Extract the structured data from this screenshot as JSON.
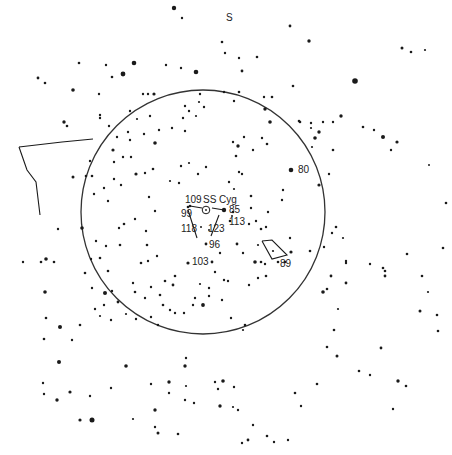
{
  "orientation_label": "S",
  "target": {
    "name": "SS Cyg",
    "x": 206,
    "y": 210
  },
  "field_circle": {
    "cx": 203,
    "cy": 212,
    "r": 122
  },
  "colors": {
    "ink": "#1a1a1a",
    "background": "#ffffff"
  },
  "labels": [
    {
      "id": "orient-s",
      "text": "S",
      "x": 226,
      "y": 13
    },
    {
      "id": "target",
      "text": "SS Cyg",
      "x": 203,
      "y": 195
    },
    {
      "id": "m109",
      "text": "109",
      "x": 185,
      "y": 195
    },
    {
      "id": "m99",
      "text": "99",
      "x": 181,
      "y": 209
    },
    {
      "id": "m85",
      "text": "85",
      "x": 229,
      "y": 205
    },
    {
      "id": "m113",
      "text": "113",
      "x": 229,
      "y": 217
    },
    {
      "id": "m118",
      "text": "118",
      "x": 181,
      "y": 224
    },
    {
      "id": "m123",
      "text": "123",
      "x": 208,
      "y": 224
    },
    {
      "id": "m96",
      "text": "96",
      "x": 209,
      "y": 240
    },
    {
      "id": "m103",
      "text": "103",
      "x": 192,
      "y": 257
    },
    {
      "id": "m80",
      "text": "80",
      "x": 298,
      "y": 165
    },
    {
      "id": "m89",
      "text": "89",
      "x": 280,
      "y": 259
    }
  ],
  "comparison_stars": [
    {
      "label": "109",
      "x": 190,
      "y": 206,
      "r": 1.3
    },
    {
      "label": "99",
      "x": 188,
      "y": 207,
      "r": 1.3
    },
    {
      "label": "85",
      "x": 224,
      "y": 210,
      "r": 2.2
    },
    {
      "label": "113",
      "x": 232,
      "y": 216,
      "r": 1.0
    },
    {
      "label": "118",
      "x": 201,
      "y": 227,
      "r": 1.0
    },
    {
      "label": "123",
      "x": 209,
      "y": 230,
      "r": 1.0
    },
    {
      "label": "96",
      "x": 206,
      "y": 244,
      "r": 1.4
    },
    {
      "label": "103",
      "x": 188,
      "y": 263,
      "r": 1.6
    },
    {
      "label": "80",
      "x": 291,
      "y": 170,
      "r": 2.3
    },
    {
      "label": "89",
      "x": 278,
      "y": 262,
      "r": 1.3
    }
  ],
  "lines": [
    {
      "pts": [
        [
          190,
          206
        ],
        [
          202,
          208
        ]
      ]
    },
    {
      "pts": [
        [
          212,
          208
        ],
        [
          224,
          210
        ]
      ]
    },
    {
      "pts": [
        [
          188,
          210
        ],
        [
          197,
          238
        ]
      ]
    },
    {
      "pts": [
        [
          219,
          215
        ],
        [
          211,
          236
        ]
      ]
    },
    {
      "pts": [
        [
          262,
          241
        ],
        [
          272,
          240
        ],
        [
          287,
          255
        ],
        [
          272,
          259
        ],
        [
          262,
          241
        ]
      ]
    },
    {
      "pts": [
        [
          19,
          147
        ],
        [
          62,
          142
        ],
        [
          93,
          139
        ]
      ]
    },
    {
      "pts": [
        [
          19,
          147
        ],
        [
          27,
          170
        ],
        [
          36,
          182
        ],
        [
          40,
          215
        ]
      ]
    }
  ],
  "stars": [
    [
      174,
      8,
      2.2
    ],
    [
      182,
      18,
      1.2
    ],
    [
      38,
      78,
      1.4
    ],
    [
      45,
      83,
      1.3
    ],
    [
      73,
      90,
      1.8
    ],
    [
      79,
      63,
      1.3
    ],
    [
      106,
      65,
      1.2
    ],
    [
      134,
      63,
      2.3
    ],
    [
      123,
      74,
      2.4
    ],
    [
      166,
      65,
      1.2
    ],
    [
      181,
      68,
      1.2
    ],
    [
      196,
      72,
      2.3
    ],
    [
      222,
      42,
      1.3
    ],
    [
      242,
      71,
      1.4
    ],
    [
      200,
      94,
      1.2
    ],
    [
      148,
      94,
      1.2
    ],
    [
      143,
      94,
      1.2
    ],
    [
      154,
      94,
      1.6
    ],
    [
      112,
      77,
      1.3
    ],
    [
      99,
      94,
      1.2
    ],
    [
      64,
      122,
      1.7
    ],
    [
      67,
      126,
      1.3
    ],
    [
      100,
      118,
      1.2
    ],
    [
      130,
      111,
      1.2
    ],
    [
      225,
      53,
      1.2
    ],
    [
      239,
      58,
      1.2
    ],
    [
      257,
      57,
      1.3
    ],
    [
      290,
      26,
      1.4
    ],
    [
      309,
      41,
      1.7
    ],
    [
      402,
      48,
      1.5
    ],
    [
      411,
      52,
      1.3
    ],
    [
      425,
      50,
      1.1
    ],
    [
      355,
      81,
      2.8
    ],
    [
      293,
      86,
      1.3
    ],
    [
      264,
      97,
      1.2
    ],
    [
      239,
      92,
      1.3
    ],
    [
      265,
      109,
      1.7
    ],
    [
      272,
      97,
      1.3
    ],
    [
      270,
      122,
      1.8
    ],
    [
      300,
      122,
      1.3
    ],
    [
      311,
      123,
      1.2
    ],
    [
      323,
      122,
      1.2
    ],
    [
      333,
      122,
      1.2
    ],
    [
      341,
      116,
      1.7
    ],
    [
      363,
      127,
      1.3
    ],
    [
      374,
      130,
      1.2
    ],
    [
      315,
      138,
      1.8
    ],
    [
      319,
      132,
      1.7
    ],
    [
      311,
      128,
      1.1
    ],
    [
      299,
      121,
      1.3
    ],
    [
      312,
      147,
      1.1
    ],
    [
      391,
      150,
      1.2
    ],
    [
      383,
      137,
      2.0
    ],
    [
      397,
      142,
      1.6
    ],
    [
      429,
      165,
      1.0
    ],
    [
      446,
      203,
      1.3
    ],
    [
      443,
      248,
      1.3
    ],
    [
      422,
      276,
      1.3
    ],
    [
      383,
      268,
      1.3
    ],
    [
      385,
      276,
      1.4
    ],
    [
      428,
      292,
      1.1
    ],
    [
      420,
      311,
      1.5
    ],
    [
      437,
      315,
      1.3
    ],
    [
      438,
      331,
      1.3
    ],
    [
      334,
      330,
      1.3
    ],
    [
      338,
      309,
      1.1
    ],
    [
      398,
      381,
      1.7
    ],
    [
      406,
      386,
      1.3
    ],
    [
      359,
      371,
      1.3
    ],
    [
      370,
      375,
      1.2
    ],
    [
      393,
      409,
      1.2
    ],
    [
      381,
      348,
      1.4
    ],
    [
      327,
      347,
      1.3
    ],
    [
      337,
      356,
      1.5
    ],
    [
      317,
      384,
      1.3
    ],
    [
      301,
      406,
      1.2
    ],
    [
      295,
      393,
      1.3
    ],
    [
      267,
      436,
      1.3
    ],
    [
      248,
      440,
      1.4
    ],
    [
      242,
      443,
      1.2
    ],
    [
      253,
      425,
      1.2
    ],
    [
      274,
      442,
      1.2
    ],
    [
      288,
      440,
      1.2
    ],
    [
      233,
      407,
      1.1
    ],
    [
      220,
      406,
      1.7
    ],
    [
      234,
      387,
      1.2
    ],
    [
      203,
      305,
      1.9
    ],
    [
      193,
      305,
      1.2
    ],
    [
      231,
      318,
      1.2
    ],
    [
      245,
      325,
      1.3
    ],
    [
      243,
      330,
      1.1
    ],
    [
      258,
      278,
      1.2
    ],
    [
      266,
      276,
      1.3
    ],
    [
      323,
      292,
      1.8
    ],
    [
      327,
      289,
      1.3
    ],
    [
      346,
      283,
      1.4
    ],
    [
      331,
      276,
      1.4
    ],
    [
      346,
      263,
      1.2
    ],
    [
      370,
      264,
      1.2
    ],
    [
      385,
      271,
      1.3
    ],
    [
      407,
      254,
      1.3
    ],
    [
      310,
      251,
      1.3
    ],
    [
      336,
      227,
      1.3
    ],
    [
      290,
      238,
      1.2
    ],
    [
      268,
      212,
      1.2
    ],
    [
      266,
      227,
      1.2
    ],
    [
      251,
      196,
      1.3
    ],
    [
      282,
      200,
      1.2
    ],
    [
      283,
      190,
      1.2
    ],
    [
      251,
      208,
      1.2
    ],
    [
      249,
      224,
      1.2
    ],
    [
      256,
      221,
      1.2
    ],
    [
      261,
      229,
      1.3
    ],
    [
      258,
      245,
      1.1
    ],
    [
      243,
      253,
      1.2
    ],
    [
      237,
      244,
      1.4
    ],
    [
      255,
      262,
      1.8
    ],
    [
      261,
      262,
      1.3
    ],
    [
      265,
      264,
      1.2
    ],
    [
      285,
      262,
      1.3
    ],
    [
      291,
      252,
      1.6
    ],
    [
      273,
      251,
      1.1
    ],
    [
      332,
      233,
      1.2
    ],
    [
      324,
      247,
      1.2
    ],
    [
      346,
      261,
      1.2
    ],
    [
      319,
      185,
      1.6
    ],
    [
      329,
      174,
      1.2
    ],
    [
      333,
      150,
      1.3
    ],
    [
      343,
      238,
      1.1
    ],
    [
      228,
      281,
      1.2
    ],
    [
      212,
      262,
      1.4
    ],
    [
      224,
      280,
      1.2
    ],
    [
      249,
      285,
      1.2
    ],
    [
      222,
      300,
      1.2
    ],
    [
      209,
      288,
      1.2
    ],
    [
      233,
      212,
      1.3
    ],
    [
      230,
      221,
      1.3
    ],
    [
      242,
      174,
      1.2
    ],
    [
      229,
      182,
      1.2
    ],
    [
      234,
      189,
      1.1
    ],
    [
      239,
      172,
      1.2
    ],
    [
      189,
      163,
      1.1
    ],
    [
      206,
      167,
      1.2
    ],
    [
      198,
      174,
      1.2
    ],
    [
      181,
      166,
      1.2
    ],
    [
      179,
      183,
      1.2
    ],
    [
      170,
      181,
      1.1
    ],
    [
      153,
      169,
      1.3
    ],
    [
      145,
      173,
      1.2
    ],
    [
      136,
      174,
      1.6
    ],
    [
      149,
      197,
      1.2
    ],
    [
      155,
      211,
      1.2
    ],
    [
      121,
      185,
      1.2
    ],
    [
      114,
      179,
      1.2
    ],
    [
      123,
      157,
      1.2
    ],
    [
      131,
      157,
      1.2
    ],
    [
      137,
      119,
      1.1
    ],
    [
      128,
      132,
      1.2
    ],
    [
      130,
      140,
      1.2
    ],
    [
      144,
      134,
      1.2
    ],
    [
      150,
      116,
      1.2
    ],
    [
      155,
      143,
      1.8
    ],
    [
      159,
      130,
      1.2
    ],
    [
      172,
      128,
      1.2
    ],
    [
      185,
      131,
      1.2
    ],
    [
      183,
      118,
      1.2
    ],
    [
      189,
      111,
      1.2
    ],
    [
      196,
      116,
      1.1
    ],
    [
      185,
      106,
      1.2
    ],
    [
      199,
      102,
      1.1
    ],
    [
      204,
      107,
      1.2
    ],
    [
      224,
      92,
      1.2
    ],
    [
      234,
      101,
      1.2
    ],
    [
      233,
      142,
      1.2
    ],
    [
      238,
      146,
      1.7
    ],
    [
      244,
      137,
      1.2
    ],
    [
      236,
      156,
      1.3
    ],
    [
      253,
      150,
      1.2
    ],
    [
      262,
      138,
      1.2
    ],
    [
      267,
      144,
      1.3
    ],
    [
      100,
      115,
      1.2
    ],
    [
      109,
      126,
      1.2
    ],
    [
      113,
      150,
      1.6
    ],
    [
      117,
      137,
      1.2
    ],
    [
      114,
      162,
      1.2
    ],
    [
      92,
      176,
      1.3
    ],
    [
      104,
      188,
      1.2
    ],
    [
      108,
      201,
      1.2
    ],
    [
      124,
      224,
      1.3
    ],
    [
      119,
      228,
      1.2
    ],
    [
      135,
      219,
      1.2
    ],
    [
      147,
      245,
      1.3
    ],
    [
      148,
      261,
      1.2
    ],
    [
      141,
      263,
      1.3
    ],
    [
      146,
      231,
      1.2
    ],
    [
      157,
      256,
      1.2
    ],
    [
      120,
      245,
      1.3
    ],
    [
      96,
      241,
      1.2
    ],
    [
      91,
      259,
      1.2
    ],
    [
      92,
      288,
      1.2
    ],
    [
      106,
      246,
      1.2
    ],
    [
      100,
      258,
      1.3
    ],
    [
      108,
      271,
      1.3
    ],
    [
      112,
      291,
      1.2
    ],
    [
      95,
      309,
      1.2
    ],
    [
      111,
      320,
      1.2
    ],
    [
      126,
      314,
      1.1
    ],
    [
      135,
      292,
      1.3
    ],
    [
      133,
      283,
      1.2
    ],
    [
      151,
      287,
      1.2
    ],
    [
      165,
      281,
      1.3
    ],
    [
      173,
      285,
      1.4
    ],
    [
      175,
      276,
      1.3
    ],
    [
      145,
      298,
      1.2
    ],
    [
      160,
      295,
      1.3
    ],
    [
      163,
      305,
      1.3
    ],
    [
      170,
      310,
      1.2
    ],
    [
      184,
      313,
      1.2
    ],
    [
      195,
      298,
      1.2
    ],
    [
      220,
      253,
      1.2
    ],
    [
      215,
      272,
      1.2
    ],
    [
      200,
      284,
      1.1
    ],
    [
      209,
      296,
      1.2
    ],
    [
      175,
      313,
      1.2
    ],
    [
      151,
      317,
      1.2
    ],
    [
      136,
      319,
      1.2
    ],
    [
      158,
      325,
      1.2
    ],
    [
      118,
      302,
      1.4
    ],
    [
      104,
      305,
      1.2
    ],
    [
      100,
      316,
      1.1
    ],
    [
      82,
      228,
      1.8
    ],
    [
      94,
      194,
      1.2
    ],
    [
      86,
      176,
      1.3
    ],
    [
      90,
      161,
      1.2
    ],
    [
      73,
      177,
      1.5
    ],
    [
      58,
      229,
      1.2
    ],
    [
      46,
      259,
      1.8
    ],
    [
      41,
      262,
      1.3
    ],
    [
      54,
      262,
      1.3
    ],
    [
      23,
      262,
      1.2
    ],
    [
      45,
      292,
      1.8
    ],
    [
      46,
      318,
      1.3
    ],
    [
      85,
      273,
      1.3
    ],
    [
      105,
      293,
      2.0
    ],
    [
      60,
      327,
      2.0
    ],
    [
      80,
      325,
      1.3
    ],
    [
      44,
      339,
      1.3
    ],
    [
      72,
      340,
      1.2
    ],
    [
      59,
      362,
      2.0
    ],
    [
      43,
      383,
      1.2
    ],
    [
      70,
      392,
      1.6
    ],
    [
      57,
      400,
      1.7
    ],
    [
      44,
      394,
      1.2
    ],
    [
      90,
      396,
      1.2
    ],
    [
      80,
      420,
      1.6
    ],
    [
      92,
      420,
      2.5
    ],
    [
      111,
      388,
      1.2
    ],
    [
      126,
      366,
      1.8
    ],
    [
      133,
      419,
      1.1
    ],
    [
      151,
      384,
      1.2
    ],
    [
      155,
      410,
      1.7
    ],
    [
      158,
      433,
      1.5
    ],
    [
      155,
      427,
      1.2
    ],
    [
      178,
      434,
      1.3
    ],
    [
      169,
      382,
      1.7
    ],
    [
      169,
      393,
      1.2
    ],
    [
      186,
      386,
      1.1
    ],
    [
      185,
      366,
      1.7
    ],
    [
      186,
      358,
      1.2
    ],
    [
      185,
      400,
      1.2
    ],
    [
      194,
      403,
      1.2
    ],
    [
      215,
      382,
      1.2
    ],
    [
      223,
      381,
      1.8
    ],
    [
      218,
      389,
      1.2
    ],
    [
      238,
      410,
      1.2
    ]
  ]
}
